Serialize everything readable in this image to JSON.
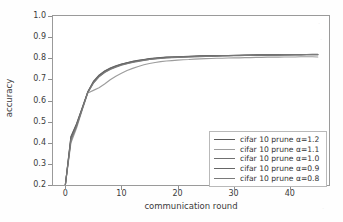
{
  "chart_data": {
    "type": "line",
    "title": "",
    "xlabel": "communication round",
    "ylabel": "accuracy",
    "xlim": [
      -2.2,
      47
    ],
    "ylim": [
      0.2,
      1.0
    ],
    "xticks": [
      0,
      10,
      20,
      30,
      40
    ],
    "xtick_labels": [
      "0",
      "10",
      "20",
      "30",
      "40"
    ],
    "yticks": [
      0.2,
      0.3,
      0.4,
      0.5,
      0.6,
      0.7,
      0.8,
      0.9,
      1.0
    ],
    "ytick_labels": [
      "0.2",
      "0.3",
      "0.4",
      "0.5",
      "0.6",
      "0.7",
      "0.8",
      "0.9",
      "1.0"
    ],
    "grid": false,
    "legend_position": "lower right",
    "x": [
      0,
      1,
      2,
      3,
      4,
      5,
      6,
      7,
      8,
      9,
      10,
      11,
      12,
      13,
      14,
      15,
      16,
      17,
      18,
      19,
      20,
      21,
      22,
      23,
      24,
      25,
      26,
      27,
      28,
      29,
      30,
      31,
      32,
      33,
      34,
      35,
      36,
      37,
      38,
      39,
      40,
      41,
      42,
      43,
      44,
      45
    ],
    "series": [
      {
        "name": "cifar 10 prune α=1.2",
        "color": "#5b5b5b",
        "values": [
          0.2,
          0.43,
          0.49,
          0.565,
          0.64,
          0.688,
          0.718,
          0.738,
          0.752,
          0.762,
          0.771,
          0.778,
          0.784,
          0.789,
          0.793,
          0.797,
          0.8,
          0.802,
          0.804,
          0.805,
          0.806,
          0.807,
          0.808,
          0.809,
          0.81,
          0.811,
          0.811,
          0.812,
          0.812,
          0.813,
          0.813,
          0.814,
          0.814,
          0.815,
          0.815,
          0.815,
          0.816,
          0.816,
          0.816,
          0.817,
          0.817,
          0.817,
          0.817,
          0.818,
          0.818,
          0.818
        ]
      },
      {
        "name": "cifar 10 prune α=1.1",
        "color": "#9d9d9d",
        "values": [
          0.2,
          0.4,
          0.47,
          0.555,
          0.636,
          0.648,
          0.66,
          0.678,
          0.698,
          0.715,
          0.729,
          0.742,
          0.752,
          0.761,
          0.769,
          0.775,
          0.78,
          0.784,
          0.787,
          0.789,
          0.791,
          0.793,
          0.794,
          0.796,
          0.797,
          0.798,
          0.799,
          0.8,
          0.8,
          0.801,
          0.802,
          0.802,
          0.803,
          0.803,
          0.804,
          0.804,
          0.805,
          0.805,
          0.805,
          0.806,
          0.806,
          0.806,
          0.807,
          0.807,
          0.807,
          0.806
        ]
      },
      {
        "name": "cifar 10 prune α=1.0",
        "color": "#707070",
        "values": [
          0.2,
          0.418,
          0.482,
          0.56,
          0.638,
          0.684,
          0.714,
          0.734,
          0.749,
          0.76,
          0.769,
          0.776,
          0.782,
          0.787,
          0.791,
          0.795,
          0.798,
          0.801,
          0.803,
          0.804,
          0.805,
          0.806,
          0.807,
          0.808,
          0.809,
          0.81,
          0.81,
          0.811,
          0.812,
          0.812,
          0.813,
          0.813,
          0.814,
          0.814,
          0.814,
          0.815,
          0.815,
          0.815,
          0.816,
          0.816,
          0.816,
          0.817,
          0.817,
          0.817,
          0.817,
          0.817
        ]
      },
      {
        "name": "cifar 10 prune α=0.9",
        "color": "#666666",
        "values": [
          0.2,
          0.425,
          0.487,
          0.563,
          0.641,
          0.69,
          0.72,
          0.74,
          0.754,
          0.764,
          0.772,
          0.779,
          0.785,
          0.79,
          0.794,
          0.798,
          0.801,
          0.803,
          0.805,
          0.806,
          0.807,
          0.808,
          0.809,
          0.81,
          0.811,
          0.811,
          0.812,
          0.812,
          0.813,
          0.813,
          0.814,
          0.814,
          0.815,
          0.815,
          0.816,
          0.816,
          0.816,
          0.817,
          0.817,
          0.817,
          0.818,
          0.818,
          0.818,
          0.818,
          0.819,
          0.819
        ]
      },
      {
        "name": "cifar 10 prune α=0.8",
        "color": "#7a7a7a",
        "values": [
          0.2,
          0.412,
          0.478,
          0.558,
          0.637,
          0.682,
          0.712,
          0.732,
          0.747,
          0.758,
          0.767,
          0.774,
          0.78,
          0.785,
          0.79,
          0.794,
          0.797,
          0.799,
          0.801,
          0.803,
          0.804,
          0.805,
          0.806,
          0.807,
          0.808,
          0.809,
          0.809,
          0.81,
          0.811,
          0.811,
          0.812,
          0.812,
          0.813,
          0.813,
          0.814,
          0.814,
          0.815,
          0.815,
          0.815,
          0.816,
          0.816,
          0.816,
          0.816,
          0.817,
          0.817,
          0.817
        ]
      }
    ]
  },
  "legend": {
    "entries": [
      "cifar 10 prune α=1.2",
      "cifar 10 prune α=1.1",
      "cifar 10 prune α=1.0",
      "cifar 10 prune α=0.9",
      "cifar 10 prune α=0.8"
    ]
  },
  "axes": {
    "xlabel": "communication round",
    "ylabel": "accuracy"
  }
}
